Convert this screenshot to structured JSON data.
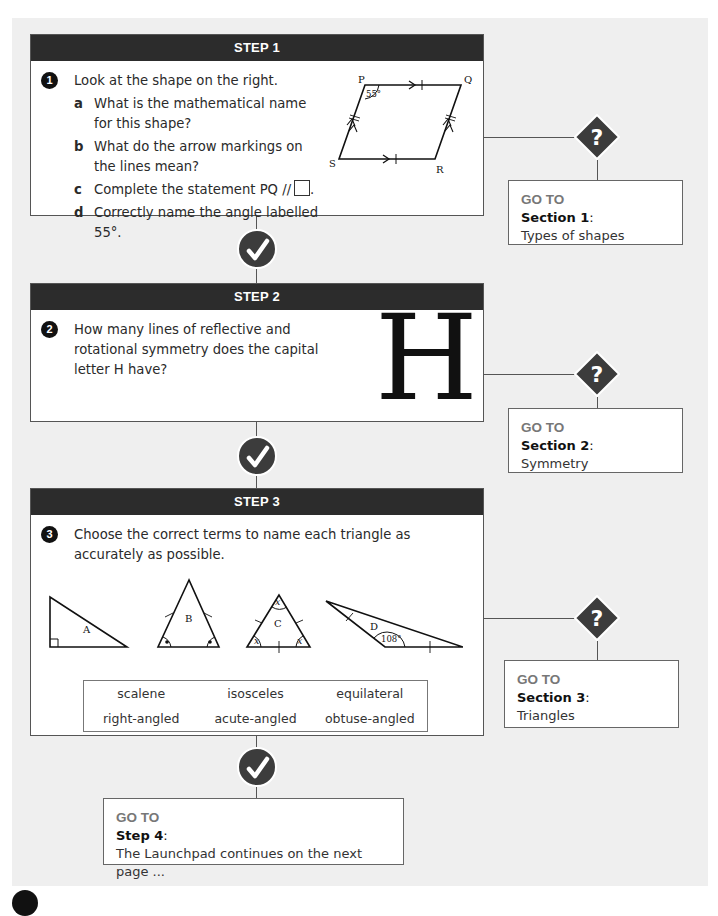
{
  "steps": [
    {
      "header": "STEP 1",
      "question_number": "1",
      "question_text": "Look at the shape on the right.",
      "sub_questions": [
        {
          "letter": "a",
          "text": "What is the mathematical name for this shape?"
        },
        {
          "letter": "b",
          "text": "What do the arrow markings on the lines mean?"
        },
        {
          "letter": "c",
          "text": "Complete the statement PQ //",
          "suffix": "."
        },
        {
          "letter": "d",
          "text": "Correctly name the angle labelled 55°."
        }
      ],
      "diagram": {
        "type": "parallelogram",
        "vertices": [
          "P",
          "Q",
          "R",
          "S"
        ],
        "angle_label": "55°"
      }
    },
    {
      "header": "STEP 2",
      "question_number": "2",
      "question_text": "How many lines of reflective and rotational symmetry does the capital letter H have?",
      "diagram": {
        "letter": "H"
      }
    },
    {
      "header": "STEP 3",
      "question_number": "3",
      "question_text": "Choose the correct terms to name each triangle as accurately as possible.",
      "triangles": [
        {
          "label": "A"
        },
        {
          "label": "B"
        },
        {
          "label": "C",
          "angle_labels": [
            "x",
            "x",
            "x"
          ]
        },
        {
          "label": "D",
          "angle_label": "108°"
        }
      ],
      "terms": [
        "scalene",
        "isosceles",
        "equilateral",
        "right-angled",
        "acute-angled",
        "obtuse-angled"
      ]
    }
  ],
  "goto_boxes": [
    {
      "label": "GO TO",
      "section": "Section 1",
      "colon": ":",
      "topic": "Types of shapes"
    },
    {
      "label": "GO TO",
      "section": "Section 2",
      "colon": ":",
      "topic": "Symmetry"
    },
    {
      "label": "GO TO",
      "section": "Section 3",
      "colon": ":",
      "topic": "Triangles"
    }
  ],
  "final_goto": {
    "label": "GO TO",
    "section": "Step 4",
    "colon": ":",
    "topic": "The Launchpad continues on the next page ..."
  },
  "icons": {
    "check": "check-circle-icon",
    "question": "question-diamond-icon"
  },
  "colors": {
    "header_bg": "#2c2c2c",
    "page_bg": "#efefef",
    "icon_fill": "#3c3c3c",
    "goto_label": "#777777"
  }
}
